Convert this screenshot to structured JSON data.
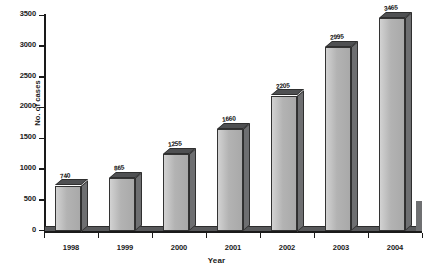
{
  "chart_data": {
    "type": "bar",
    "title": "",
    "xlabel": "Year",
    "ylabel": "No. of cases",
    "categories": [
      "1998",
      "1999",
      "2000",
      "2001",
      "2002",
      "2003",
      "2004"
    ],
    "values": [
      740,
      865,
      1255,
      1660,
      2205,
      2995,
      3465
    ],
    "data_labels": [
      "740",
      "865",
      "1255",
      "1660",
      "2205",
      "2995",
      "3465"
    ],
    "ylim": [
      0,
      3500
    ],
    "ytick_values": [
      0,
      500,
      1000,
      1500,
      2000,
      2500,
      3000,
      3500
    ],
    "ytick_labels": [
      "0",
      "500",
      "1000",
      "1500",
      "2000",
      "2500",
      "3000",
      "3500"
    ],
    "grid": false,
    "legend": null,
    "style": "3d-column",
    "colors": {
      "bar_front": "#b9b9b9",
      "bar_side": "#6e6f71",
      "bar_top": "#4f5052",
      "axis": "#1a1a1a",
      "floor": "#58595b",
      "background": "#ffffff",
      "label_text": "#111111"
    }
  }
}
